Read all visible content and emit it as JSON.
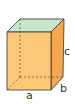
{
  "diagram": {
    "type": "cuboid",
    "labels": {
      "width": "a",
      "depth": "b",
      "height": "c"
    },
    "colors": {
      "front_face": "#fbc878",
      "side_face": "#f6a64c",
      "top_face": "#c9e6cc",
      "edge": "#333333",
      "hidden_edge": "#5a4a3a"
    }
  }
}
